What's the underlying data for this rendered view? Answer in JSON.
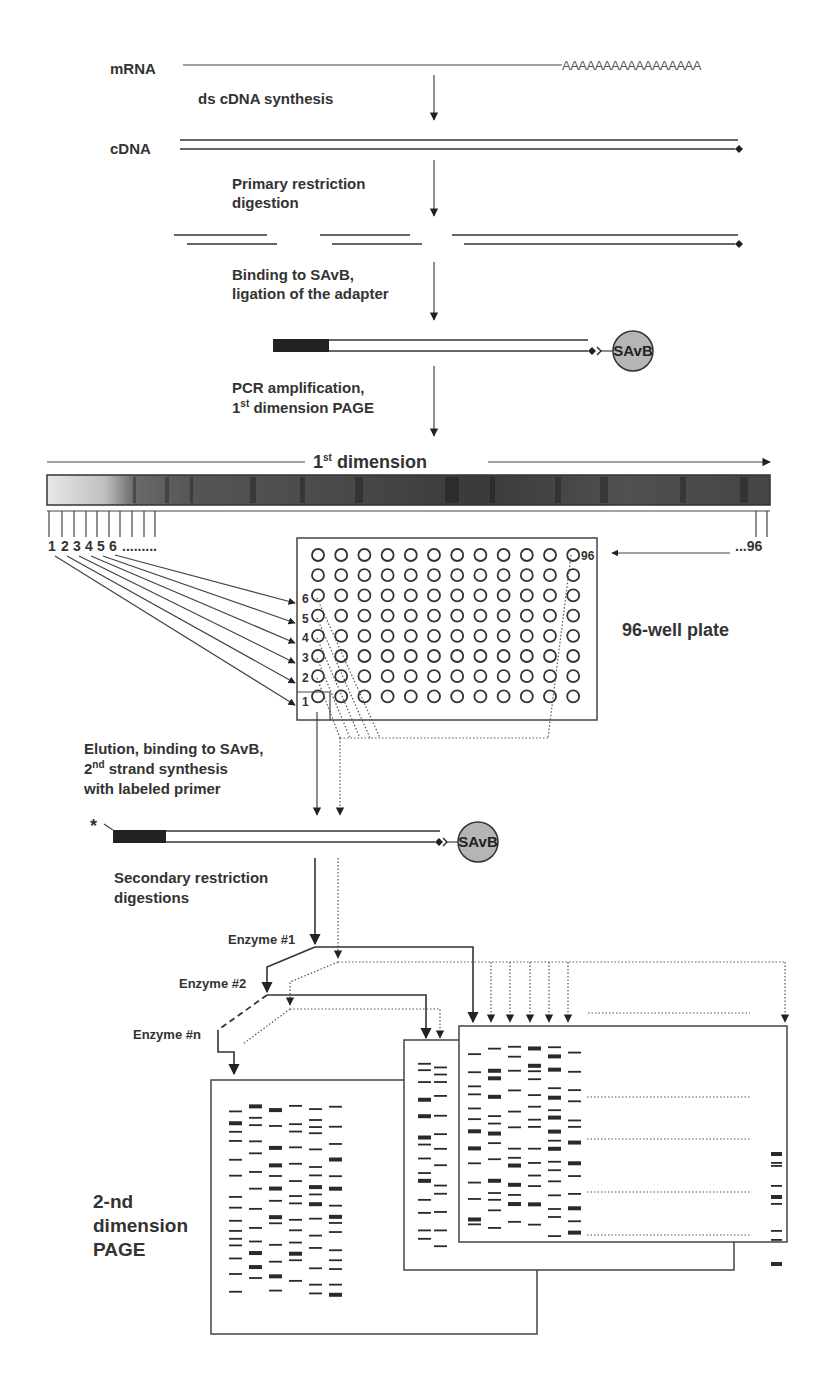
{
  "steps": {
    "mrna_label": "mRNA",
    "polyA_tail": "AAAAAAAAAAAAAAAAA",
    "step1": "ds cDNA synthesis",
    "cdna_label": "cDNA",
    "step2_line1": "Primary restriction",
    "step2_line2": "digestion",
    "step3_line1": "Binding to SAvB,",
    "step3_line2": "ligation of the adapter",
    "step4_line1": "PCR amplification,",
    "step4_line2_num": "1",
    "step4_line2_sup": "st",
    "step4_line2_rest": " dimension PAGE",
    "step5_line1": "Elution, binding to SAvB,",
    "step5_line2_num": "2",
    "step5_line2_sup": "nd",
    "step5_line2_rest": " strand synthesis",
    "step5_line3": "with labeled primer",
    "step6_line1": "Secondary restriction",
    "step6_line2": "digestions"
  },
  "savb_label": "SAvB",
  "label_marker": "*",
  "first_dimension": {
    "title_num": "1",
    "title_sup": "st",
    "title_rest": " dimension",
    "fraction_labels": [
      "1",
      "2",
      "3",
      "4",
      "5",
      "6"
    ],
    "fraction_ellipsis": ".........",
    "last_fraction": "...96"
  },
  "plate": {
    "title": "96-well plate",
    "rows": 8,
    "cols": 12,
    "row_labels": [
      "6",
      "5",
      "4",
      "3",
      "2",
      "1"
    ],
    "last_well_label": "96"
  },
  "enzymes": [
    "Enzyme #1",
    "Enzyme #2",
    "Enzyme #n"
  ],
  "second_dimension": {
    "label_line1": "2-nd",
    "label_line2": "dimension",
    "label_line3": "PAGE"
  }
}
